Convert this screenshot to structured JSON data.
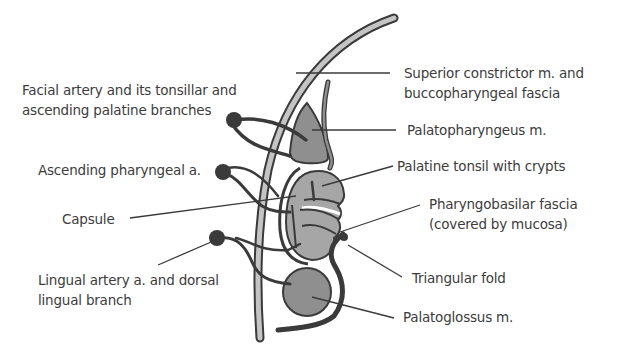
{
  "diagram": {
    "type": "anatomical-diagram",
    "colors": {
      "muscle_fill": "#8f8f8f",
      "tonsil_fill": "#a6a6a6",
      "outline": "#3a3a3a",
      "constrictor_fill": "#c4c4c4",
      "text": "#3c3c3c"
    },
    "labels_left": [
      {
        "id": "facial-artery",
        "line1": "Facial artery and its tonsillar and",
        "line2": "ascending palatine branches"
      },
      {
        "id": "ascending-pharyngeal",
        "line1": "Ascending pharyngeal a."
      },
      {
        "id": "capsule",
        "line1": "Capsule"
      },
      {
        "id": "lingual-artery",
        "line1": "Lingual artery a. and dorsal",
        "line2": "lingual branch"
      }
    ],
    "labels_right": [
      {
        "id": "superior-constrictor",
        "line1": "Superior constrictor m. and",
        "line2": "buccopharyngeal fascia"
      },
      {
        "id": "palatopharyngeus",
        "line1": "Palatopharyngeus m."
      },
      {
        "id": "palatine-tonsil",
        "line1": "Palatine tonsil with crypts"
      },
      {
        "id": "pharyngobasilar-fascia",
        "line1": "Pharyngobasilar fascia",
        "line2": "(covered by mucosa)"
      },
      {
        "id": "triangular-fold",
        "line1": "Triangular fold"
      },
      {
        "id": "palatoglossus",
        "line1": "Palatoglossus m."
      }
    ]
  }
}
